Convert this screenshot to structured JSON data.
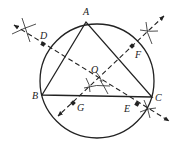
{
  "diagram": {
    "colors": {
      "ink": "#222222",
      "background": "#ffffff"
    },
    "circle": {
      "cx": 97,
      "cy": 81,
      "r": 57
    },
    "points": {
      "A": {
        "label": "A",
        "x": 86,
        "y": 22,
        "lx": 83,
        "ly": 15
      },
      "B": {
        "label": "B",
        "x": 42,
        "y": 95,
        "lx": 32,
        "ly": 98
      },
      "C": {
        "label": "C",
        "x": 152,
        "y": 97,
        "lx": 155,
        "ly": 101
      },
      "O": {
        "label": "O",
        "x": 97,
        "y": 77,
        "lx": 91,
        "ly": 72
      },
      "D": {
        "label": "D",
        "x": 43,
        "y": 44,
        "lx": 40,
        "ly": 39
      },
      "E": {
        "label": "E",
        "x": 137,
        "y": 104,
        "lx": 124,
        "ly": 112
      },
      "F": {
        "label": "F",
        "x": 132,
        "y": 46,
        "lx": 135,
        "ly": 58
      },
      "G": {
        "label": "G",
        "x": 73,
        "y": 103,
        "lx": 77,
        "ly": 111
      }
    },
    "bisector_lines": [
      {
        "name": "DE",
        "x1": 13,
        "y1": 24,
        "x2": 170,
        "y2": 122
      },
      {
        "name": "FG",
        "x1": 165,
        "y1": 15,
        "x2": 57,
        "y2": 117
      }
    ]
  }
}
